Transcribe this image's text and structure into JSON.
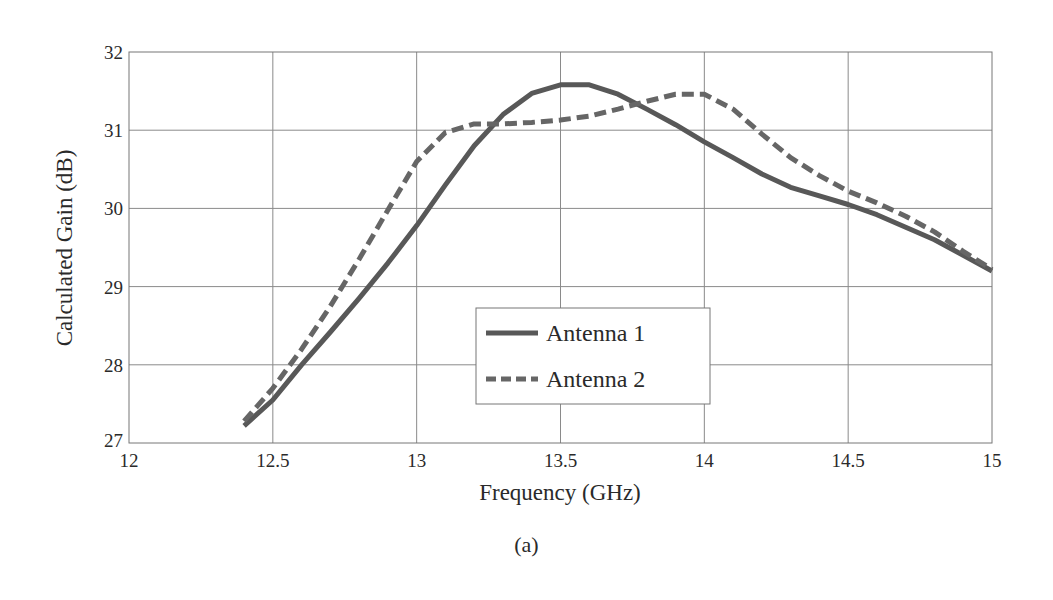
{
  "chart_data": {
    "type": "line",
    "title": "",
    "xlabel": "Frequency (GHz)",
    "ylabel": "Calculated Gain (dB)",
    "xlim": [
      12,
      15
    ],
    "ylim": [
      27,
      32
    ],
    "x_ticks": [
      "12",
      "12.5",
      "13",
      "13.5",
      "14",
      "14.5",
      "15"
    ],
    "y_ticks": [
      "27",
      "28",
      "29",
      "30",
      "31",
      "32"
    ],
    "grid": true,
    "legend_position": "center-lower (inside plot)",
    "x": [
      12.4,
      12.5,
      12.6,
      12.7,
      12.8,
      12.9,
      13.0,
      13.1,
      13.2,
      13.3,
      13.4,
      13.5,
      13.6,
      13.7,
      13.8,
      13.9,
      14.0,
      14.1,
      14.2,
      14.3,
      14.4,
      14.5,
      14.6,
      14.7,
      14.8,
      14.9,
      15.0
    ],
    "series": [
      {
        "name": "Antenna 1",
        "style": "solid",
        "color": "#585858",
        "values": [
          27.22,
          27.55,
          28.0,
          28.42,
          28.85,
          29.3,
          29.78,
          30.3,
          30.8,
          31.2,
          31.47,
          31.58,
          31.58,
          31.46,
          31.27,
          31.07,
          30.85,
          30.65,
          30.44,
          30.27,
          30.16,
          30.05,
          29.92,
          29.76,
          29.6,
          29.4,
          29.2
        ]
      },
      {
        "name": "Antenna 2",
        "style": "dashed",
        "color": "#666666",
        "values": [
          27.28,
          27.7,
          28.2,
          28.75,
          29.35,
          29.98,
          30.6,
          30.97,
          31.08,
          31.08,
          31.1,
          31.13,
          31.18,
          31.27,
          31.37,
          31.46,
          31.46,
          31.27,
          30.95,
          30.65,
          30.42,
          30.22,
          30.07,
          29.9,
          29.7,
          29.45,
          29.22
        ]
      }
    ],
    "caption": "(a)"
  },
  "legend": {
    "items": [
      "Antenna 1",
      "Antenna 2"
    ]
  }
}
